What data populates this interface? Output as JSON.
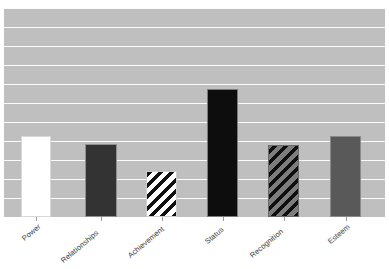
{
  "chart_data": {
    "type": "bar",
    "title": "",
    "subtitle": "",
    "xlabel": "",
    "ylabel": "",
    "categories": [
      "Power",
      "Relationships",
      "Achievement",
      "Status",
      "Recognition",
      "Esteem"
    ],
    "values": [
      4.2,
      3.8,
      2.4,
      6.7,
      3.75,
      4.25
    ],
    "ylim": [
      0,
      11
    ],
    "grid": true,
    "gridline_count": 11,
    "legend": "none",
    "legend_position": "none",
    "tick_labels_y": [],
    "tick_labels_x": [
      "Power",
      "Relationships",
      "Achievement",
      "Status",
      "Recognition",
      "Esteem"
    ],
    "x_tick_label_rotation": -40,
    "annotations": [],
    "plot_background_color": "#bfbfbf",
    "gridline_color": "#fbfbfb",
    "bars": [
      {
        "category": "Power",
        "value": 4.2,
        "fill_style": "solid",
        "fill_color": "#ffffff",
        "edge_color": "#d8d8d8",
        "left_px": 21,
        "width_px": 30,
        "top_px": 136,
        "height_px": 81
      },
      {
        "category": "Relationships",
        "value": 3.8,
        "fill_style": "solid",
        "fill_color": "#333333",
        "edge_color": "#8f8f8f",
        "left_px": 85,
        "width_px": 32,
        "top_px": 144,
        "height_px": 73
      },
      {
        "category": "Achievement",
        "value": 2.4,
        "fill_style": "diagonal-hatch",
        "fill_color": "#ffffff",
        "hatch_color": "#111111",
        "edge_color": "#cfcfcf",
        "left_px": 146,
        "width_px": 31,
        "top_px": 171,
        "height_px": 46
      },
      {
        "category": "Status",
        "value": 6.7,
        "fill_style": "solid",
        "fill_color": "#0d0d0d",
        "edge_color": "#7a7a7a",
        "left_px": 207,
        "width_px": 31,
        "top_px": 89,
        "height_px": 128
      },
      {
        "category": "Recognition",
        "value": 3.75,
        "fill_style": "diagonal-hatch",
        "fill_color": "#7d7d7d",
        "hatch_color": "#0f0f0f",
        "edge_color": "#6a6a6a",
        "left_px": 268,
        "width_px": 31,
        "top_px": 145,
        "height_px": 72
      },
      {
        "category": "Esteem",
        "value": 4.25,
        "fill_style": "solid",
        "fill_color": "#595959",
        "edge_color": "#8a8a8a",
        "left_px": 330,
        "width_px": 31,
        "top_px": 136,
        "height_px": 81
      }
    ]
  }
}
